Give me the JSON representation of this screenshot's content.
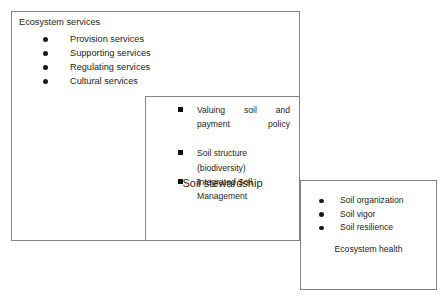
{
  "diagram": {
    "boxes": [
      {
        "id": "ecosystem-services",
        "title": "Ecosystem services",
        "bullet_style": "round",
        "items": [
          "Provision services",
          "Supporting services",
          "Regulating services",
          "Cultural services"
        ]
      },
      {
        "id": "soil-stewardship",
        "caption": "Soil stewardship",
        "bullet_style": "square",
        "items": [
          "Valuing soil and payment policy",
          "Soil structure (biodiversity)",
          "Integrated Soil Management"
        ]
      },
      {
        "id": "ecosystem-health",
        "caption": "Ecosystem health",
        "bullet_style": "round",
        "items": [
          "Soil organization",
          "Soil vigor",
          "Soil resilience"
        ]
      }
    ]
  },
  "colors": {
    "border": "#838383",
    "text": "#231f20",
    "bullet": "#111111",
    "background": "#ffffff"
  }
}
